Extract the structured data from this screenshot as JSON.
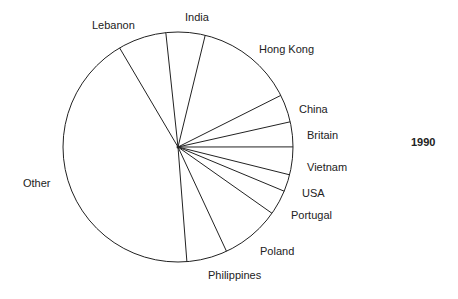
{
  "chart_data": {
    "type": "pie",
    "title": "1990",
    "categories": [
      "Hong Kong",
      "China",
      "Britain",
      "Vietnam",
      "USA",
      "Portugal",
      "Poland",
      "Philippines",
      "Other",
      "Lebanon",
      "India"
    ],
    "values": [
      13.8,
      3.9,
      3.5,
      3.9,
      2.4,
      3.5,
      8.3,
      5.7,
      42.8,
      6.8,
      5.5
    ],
    "start_angle_deg": -76.3,
    "direction": "clockwise",
    "fill": "#ffffff",
    "stroke": "#222222",
    "legend": "none (labels placed outside slices)"
  },
  "labels": {
    "year": "1990",
    "slices": [
      {
        "text": "Lebanon",
        "x": 92,
        "y": 20
      },
      {
        "text": "India",
        "x": 185,
        "y": 12
      },
      {
        "text": "Hong Kong",
        "x": 259,
        "y": 44
      },
      {
        "text": "China",
        "x": 299,
        "y": 104
      },
      {
        "text": "Britain",
        "x": 307,
        "y": 130
      },
      {
        "text": "Vietnam",
        "x": 307,
        "y": 162
      },
      {
        "text": "USA",
        "x": 302,
        "y": 188
      },
      {
        "text": "Portugal",
        "x": 291,
        "y": 210
      },
      {
        "text": "Poland",
        "x": 260,
        "y": 246
      },
      {
        "text": "Philippines",
        "x": 208,
        "y": 270
      },
      {
        "text": "Other",
        "x": 23,
        "y": 178
      }
    ]
  }
}
